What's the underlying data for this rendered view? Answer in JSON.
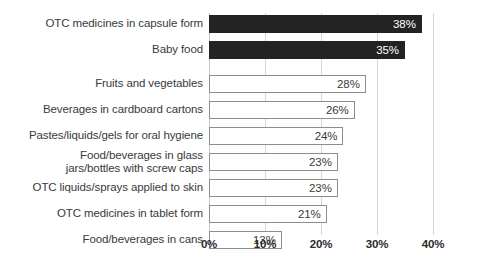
{
  "chart_data": {
    "type": "bar",
    "orientation": "horizontal",
    "title": "",
    "subtitle": "",
    "xlabel": "",
    "ylabel": "",
    "xlim": [
      0,
      40
    ],
    "grid": true,
    "legend": false,
    "xticks": [
      "0%",
      "10%",
      "20%",
      "30%",
      "40%"
    ],
    "xtick_values": [
      0,
      10,
      20,
      30,
      40
    ],
    "categories": [
      "OTC medicines in capsule form",
      "Baby food",
      "Fruits and vegetables",
      "Beverages in cardboard cartons",
      "Pastes/liquids/gels for oral hygiene",
      "Food/beverages in glass jars/bottles with screw caps",
      "OTC liquids/sprays applied to skin",
      "OTC medicines in tablet form",
      "Food/beverages in cans"
    ],
    "values": [
      38,
      35,
      28,
      26,
      24,
      23,
      23,
      21,
      13
    ],
    "value_labels": [
      "38%",
      "35%",
      "28%",
      "26%",
      "24%",
      "23%",
      "23%",
      "21%",
      "13%"
    ],
    "bars": [
      {
        "label_lines": [
          "OTC medicines in capsule form"
        ],
        "value": 38,
        "value_label": "38%",
        "style": "filled",
        "group_break_after": false
      },
      {
        "label_lines": [
          "Baby food"
        ],
        "value": 35,
        "value_label": "35%",
        "style": "filled",
        "group_break_after": true
      },
      {
        "label_lines": [
          "Fruits and vegetables"
        ],
        "value": 28,
        "value_label": "28%",
        "style": "hollow",
        "group_break_after": false
      },
      {
        "label_lines": [
          "Beverages in cardboard cartons"
        ],
        "value": 26,
        "value_label": "26%",
        "style": "hollow",
        "group_break_after": false
      },
      {
        "label_lines": [
          "Pastes/liquids/gels for oral hygiene"
        ],
        "value": 24,
        "value_label": "24%",
        "style": "hollow",
        "group_break_after": false
      },
      {
        "label_lines": [
          "Food/beverages in glass",
          "jars/bottles with screw caps"
        ],
        "value": 23,
        "value_label": "23%",
        "style": "hollow",
        "group_break_after": false
      },
      {
        "label_lines": [
          "OTC liquids/sprays applied to skin"
        ],
        "value": 23,
        "value_label": "23%",
        "style": "hollow",
        "group_break_after": false
      },
      {
        "label_lines": [
          "OTC medicines in tablet form"
        ],
        "value": 21,
        "value_label": "21%",
        "style": "hollow",
        "group_break_after": false
      },
      {
        "label_lines": [
          "Food/beverages in cans"
        ],
        "value": 13,
        "value_label": "13%",
        "style": "hollow",
        "group_break_after": false
      }
    ],
    "colors": {
      "bar_filled": "#232323",
      "bar_hollow_fill": "#ffffff",
      "bar_hollow_border": "#8d8d8d",
      "gridline": "#d6d6d6",
      "text": "#3a3a3a",
      "tick_text": "#2b2b2b",
      "background": "#ffffff"
    }
  }
}
